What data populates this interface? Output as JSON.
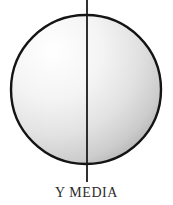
{
  "figure": {
    "caption": "Y MEDIA",
    "background_color": "#ffffff",
    "outline_color": "#141414",
    "line_color": "#1a1a1a",
    "text_color": "#2b2b2b",
    "shapes": {
      "circle": {
        "name": "shaded-sphere",
        "center_x": 86,
        "center_y": 89.5,
        "radius_x": 76,
        "radius_y": 75.5,
        "stroke_width": 2.4,
        "fill_gradient": {
          "type": "radial",
          "focus_x_pct": 28,
          "focus_y_pct": 24,
          "stops": [
            {
              "offset": "0%",
              "color": "#ffffff"
            },
            {
              "offset": "38%",
              "color": "#f4f4f4"
            },
            {
              "offset": "66%",
              "color": "#e2e2e2"
            },
            {
              "offset": "88%",
              "color": "#cccccc"
            },
            {
              "offset": "100%",
              "color": "#b6b6b6"
            }
          ]
        }
      },
      "axis_line": {
        "name": "vertical-diameter-axis",
        "x": 87,
        "y_start": 0,
        "y_end": 182,
        "stroke_width": 1.8
      }
    }
  }
}
